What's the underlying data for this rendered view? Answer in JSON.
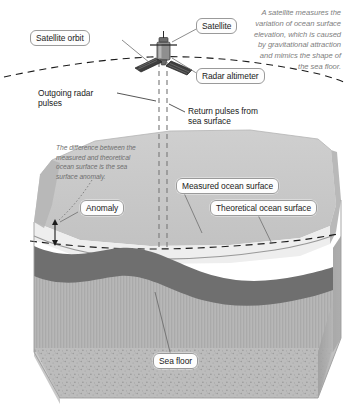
{
  "diagram": {
    "colors": {
      "ocean_top": "#c9c9c9",
      "ocean_front": "#efefef",
      "ocean_side": "#bdbdbd",
      "sediment": "#7b7b7b",
      "crust": "#b0b0b0",
      "basement": "#b8b8b8",
      "line": "#1a1a1a",
      "label_border": "#9a9a9a",
      "caption_text": "#7e7e7e",
      "satellite_body": "#8c8c8c",
      "solar_panel": "#3d3d3d"
    }
  },
  "caption": {
    "text": "A satellite measures the\nvariation of ocean surface\nelevation, which is caused\nby gravitational attraction\nand mimics the shape of\nthe sea floor."
  },
  "note": {
    "text": "The difference between the\nmeasured and theoretical\nocean surface is the sea\nsurface anomaly."
  },
  "labels": {
    "satellite_orbit": "Satellite orbit",
    "satellite": "Satellite",
    "radar_altimeter": "Radar altimeter",
    "outgoing_pulses": "Outgoing radar\npulses",
    "return_pulses": "Return pulses from\nsea surface",
    "anomaly": "Anomaly",
    "measured_ocean_surface": "Measured ocean surface",
    "theoretical_ocean_surface": "Theoretical ocean surface",
    "sea_floor": "Sea floor"
  },
  "icons": {
    "satellite": "satellite-icon",
    "solar_panel_left": "solar-panel-left-icon",
    "solar_panel_right": "solar-panel-right-icon",
    "anomaly_arrow": "anomaly-double-arrow-icon"
  }
}
